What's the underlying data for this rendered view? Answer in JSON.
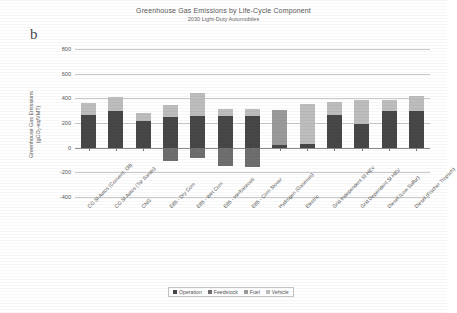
{
  "figure": {
    "panel_label": "b",
    "title": "Greenhouse Gas Emissions by Life-Cycle Component",
    "subtitle": "2030 Light-Duty Automobiles"
  },
  "legend": {
    "position": "bottom-center",
    "items": [
      {
        "label": "Operation",
        "color": "#474747"
      },
      {
        "label": "Feedstock",
        "color": "#6e6e6e"
      },
      {
        "label": "Fuel",
        "color": "#9a9a9a"
      },
      {
        "label": "Vehicle",
        "color": "#bdbdbd"
      }
    ]
  },
  "chart_data": {
    "type": "bar",
    "stacked": true,
    "title": "Greenhouse Gas Emissions by Life-Cycle Component",
    "subtitle": "2030 Light-Duty Automobiles",
    "xlabel": "",
    "ylabel": "Greenhouse Gas Emissions (gCO2-eq/VMT)",
    "ylabel_line1": "Greenhouse Gas Emissions",
    "ylabel_line2": "(gCO₂-eq/VMT)",
    "ylim": [
      -400,
      800
    ],
    "yticks": [
      800,
      600,
      400,
      200,
      0,
      -200,
      -400
    ],
    "ytick_labels": [
      "800",
      "600",
      "400",
      "200",
      "0",
      "-200",
      "-400"
    ],
    "grid": true,
    "legend_position": "bottom",
    "categories": [
      "CG SI Autos (Convent. Oil)",
      "CG SI Autos (Tar Sands)",
      "CNG",
      "E85 - Dry Corn",
      "E85 - Wet Corn",
      "E85 - Herbaceous",
      "E85 - Corn Stover",
      "Hydrogen (Gaseous)",
      "Electric",
      "Grid Independent SI HEV",
      "Grid Dependent SI HEV",
      "Diesel (Low Sulfur)",
      "Diesel (Fischer Tropsch)"
    ],
    "series": [
      {
        "name": "Operation",
        "color": "#474747",
        "values": [
          268,
          298,
          215,
          250,
          255,
          255,
          255,
          18,
          30,
          265,
          195,
          300,
          295
        ]
      },
      {
        "name": "Feedstock",
        "color": "#6e6e6e",
        "values": [
          0,
          0,
          0,
          -105,
          -85,
          -145,
          -155,
          0,
          0,
          0,
          0,
          0,
          0
        ]
      },
      {
        "name": "Fuel",
        "color": "#9a9a9a",
        "values": [
          0,
          0,
          0,
          0,
          0,
          0,
          0,
          285,
          0,
          0,
          0,
          0,
          0
        ]
      },
      {
        "name": "Vehicle",
        "color": "#bdbdbd",
        "values": [
          97,
          110,
          68,
          97,
          190,
          55,
          55,
          0,
          325,
          105,
          190,
          85,
          120
        ]
      }
    ],
    "totals": [
      365,
      408,
      283,
      347,
      445,
      310,
      310,
      303,
      355,
      370,
      385,
      385,
      415
    ]
  }
}
